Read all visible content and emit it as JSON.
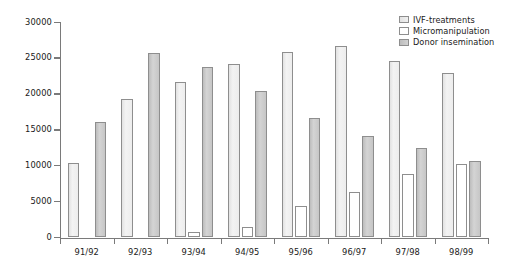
{
  "chart_data": {
    "type": "bar",
    "title": "",
    "xlabel": "",
    "ylabel": "",
    "ylim": [
      0,
      30000
    ],
    "ytick_values": [
      0,
      5000,
      10000,
      15000,
      20000,
      25000,
      30000
    ],
    "ytick_labels": [
      "0",
      "5000",
      "10000",
      "15000",
      "20000",
      "25000",
      "30000"
    ],
    "grid": false,
    "legend_position": "top-right",
    "categories": [
      "91/92",
      "92/93",
      "93/94",
      "94/95",
      "95/96",
      "96/97",
      "97/98",
      "98/99"
    ],
    "series": [
      {
        "name": "IVF-treatments",
        "color": "#ededed",
        "values": [
          10400,
          19300,
          21600,
          24100,
          25800,
          26700,
          24600,
          22900
        ]
      },
      {
        "name": "Micromanipulation",
        "color": "#ffffff",
        "values": [
          0,
          0,
          700,
          1500,
          4400,
          6300,
          8800,
          10300
        ]
      },
      {
        "name": "Donor insemination",
        "color": "#c6c6c6",
        "values": [
          16100,
          25700,
          23800,
          20400,
          16700,
          14100,
          12400,
          10700
        ]
      }
    ]
  },
  "legend": {
    "items": [
      {
        "label": "IVF-treatments",
        "swatch": "ivf-swatch"
      },
      {
        "label": "Micromanipulation",
        "swatch": "micromanipulation-swatch"
      },
      {
        "label": "Donor insemination",
        "swatch": "donor-insemination-swatch"
      }
    ]
  }
}
